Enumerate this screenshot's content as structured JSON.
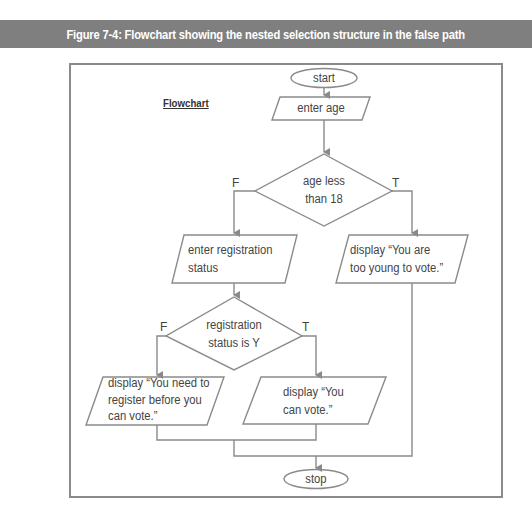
{
  "figure": {
    "title": "Figure 7-4: Flowchart showing the nested selection structure in the false path",
    "label": "Flowchart"
  },
  "colors": {
    "title_bar": "#7f7f7f",
    "title_text": "#ffffff",
    "frame_border": "#8a8a8a",
    "shape_stroke": "#8a8a8a",
    "text": "#444444"
  },
  "nodes": {
    "start": {
      "type": "terminator",
      "text": "start"
    },
    "enter_age": {
      "type": "input-output",
      "text": "enter age"
    },
    "decision_age": {
      "type": "decision",
      "line1": "age less",
      "line2": "than 18"
    },
    "enter_registration": {
      "type": "input-output",
      "line1": "enter registration",
      "line2": "status"
    },
    "display_too_young": {
      "type": "input-output",
      "line1": "display “You are",
      "line2": "too young to vote.”"
    },
    "decision_registration": {
      "type": "decision",
      "line1": "registration",
      "line2": "status is Y"
    },
    "display_need_register": {
      "type": "input-output",
      "line1": "display “You need to",
      "line2": "register before you",
      "line3": "can vote.”"
    },
    "display_can_vote": {
      "type": "input-output",
      "line1": "display “You",
      "line2": "can vote.”"
    },
    "stop": {
      "type": "terminator",
      "text": "stop"
    }
  },
  "branches": {
    "age_false": "F",
    "age_true": "T",
    "reg_false": "F",
    "reg_true": "T"
  }
}
